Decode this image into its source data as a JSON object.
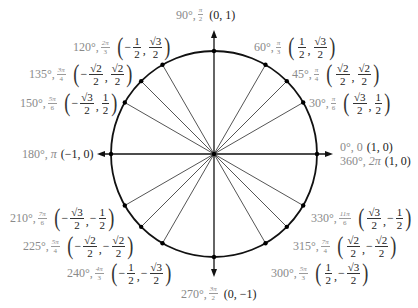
{
  "diagram": {
    "center": {
      "x": 214,
      "y": 154
    },
    "radius": 103,
    "colors": {
      "angle_label": "#8a8a8a",
      "coordinate": "#222222",
      "circle": "#111111",
      "ray": "#555555"
    },
    "axes": {
      "x_min": 97,
      "x_max": 333,
      "y_min": 30,
      "y_max": 277
    }
  },
  "points": [
    {
      "id": "p0",
      "deg": "0°",
      "rad_simple": "0",
      "coord_simple": "(1, 0)",
      "angle": 0
    },
    {
      "id": "p30",
      "deg": "30°",
      "rad_num": "π",
      "rad_den": "6",
      "x": {
        "neg": false,
        "num": "√3",
        "den": "2"
      },
      "y": {
        "neg": false,
        "num": "1",
        "den": "2"
      },
      "angle": 30
    },
    {
      "id": "p45",
      "deg": "45°",
      "rad_num": "π",
      "rad_den": "4",
      "x": {
        "neg": false,
        "num": "√2",
        "den": "2"
      },
      "y": {
        "neg": false,
        "num": "√2",
        "den": "2"
      },
      "angle": 45
    },
    {
      "id": "p60",
      "deg": "60°",
      "rad_num": "π",
      "rad_den": "3",
      "x": {
        "neg": false,
        "num": "1",
        "den": "2"
      },
      "y": {
        "neg": false,
        "num": "√3",
        "den": "2"
      },
      "angle": 60
    },
    {
      "id": "p90",
      "deg": "90°",
      "rad_num": "π",
      "rad_den": "2",
      "coord_simple": "(0, 1)",
      "angle": 90
    },
    {
      "id": "p120",
      "deg": "120°",
      "rad_num": "2π",
      "rad_den": "3",
      "x": {
        "neg": true,
        "num": "1",
        "den": "2"
      },
      "y": {
        "neg": false,
        "num": "√3",
        "den": "2"
      },
      "angle": 120
    },
    {
      "id": "p135",
      "deg": "135°",
      "rad_num": "3π",
      "rad_den": "4",
      "x": {
        "neg": true,
        "num": "√2",
        "den": "2"
      },
      "y": {
        "neg": false,
        "num": "√2",
        "den": "2"
      },
      "angle": 135
    },
    {
      "id": "p150",
      "deg": "150°",
      "rad_num": "5π",
      "rad_den": "6",
      "x": {
        "neg": true,
        "num": "√3",
        "den": "2"
      },
      "y": {
        "neg": false,
        "num": "1",
        "den": "2"
      },
      "angle": 150
    },
    {
      "id": "p180",
      "deg": "180°",
      "rad_simple": "π",
      "coord_simple": "(−1, 0)",
      "angle": 180
    },
    {
      "id": "p210",
      "deg": "210°",
      "rad_num": "7π",
      "rad_den": "6",
      "x": {
        "neg": true,
        "num": "√3",
        "den": "2"
      },
      "y": {
        "neg": true,
        "num": "1",
        "den": "2"
      },
      "angle": 210
    },
    {
      "id": "p225",
      "deg": "225°",
      "rad_num": "5π",
      "rad_den": "4",
      "x": {
        "neg": true,
        "num": "√2",
        "den": "2"
      },
      "y": {
        "neg": true,
        "num": "√2",
        "den": "2"
      },
      "angle": 225
    },
    {
      "id": "p240",
      "deg": "240°",
      "rad_num": "4π",
      "rad_den": "3",
      "x": {
        "neg": true,
        "num": "1",
        "den": "2"
      },
      "y": {
        "neg": true,
        "num": "√3",
        "den": "2"
      },
      "angle": 240
    },
    {
      "id": "p270",
      "deg": "270°",
      "rad_num": "3π",
      "rad_den": "2",
      "coord_simple": "(0, −1)",
      "angle": 270
    },
    {
      "id": "p300",
      "deg": "300°",
      "rad_num": "5π",
      "rad_den": "3",
      "x": {
        "neg": false,
        "num": "1",
        "den": "2"
      },
      "y": {
        "neg": true,
        "num": "√3",
        "den": "2"
      },
      "angle": 300
    },
    {
      "id": "p315",
      "deg": "315°",
      "rad_num": "7π",
      "rad_den": "4",
      "x": {
        "neg": false,
        "num": "√2",
        "den": "2"
      },
      "y": {
        "neg": true,
        "num": "√2",
        "den": "2"
      },
      "angle": 315
    },
    {
      "id": "p330",
      "deg": "330°",
      "rad_num": "11π",
      "rad_den": "6",
      "x": {
        "neg": false,
        "num": "√3",
        "den": "2"
      },
      "y": {
        "neg": true,
        "num": "1",
        "den": "2"
      },
      "angle": 330
    },
    {
      "id": "p360",
      "deg": "360°",
      "rad_simple": "2π",
      "coord_simple": "(1, 0)",
      "angle": 360
    }
  ]
}
